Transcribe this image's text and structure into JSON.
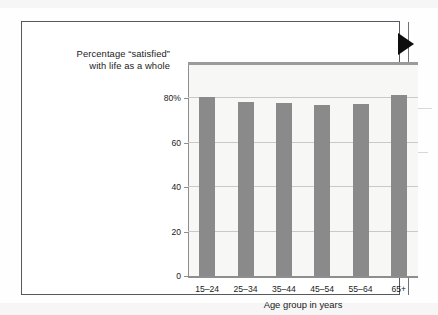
{
  "figure": {
    "marker_icon": "right-pointing-triangle"
  },
  "chart_data": {
    "type": "bar",
    "title": "Percentage “satisfied” with life as a whole",
    "title_lines": [
      "Percentage “satisfied”",
      "with life as a whole"
    ],
    "categories": [
      "15–24",
      "25–34",
      "35–44",
      "45–54",
      "55–64",
      "65+"
    ],
    "values": [
      80.5,
      78.5,
      78,
      77,
      77.5,
      81.5
    ],
    "xlabel": "Age group in years",
    "ylabel": "",
    "ylim": [
      0,
      95
    ],
    "yticks": [
      0,
      20,
      40,
      60,
      80
    ],
    "ytick_labels": [
      "0",
      "20",
      "40",
      "60",
      "80%"
    ],
    "grid": true,
    "legend": null,
    "bar_color": "#8a8a8a",
    "plot_background": "#f7f7f5"
  }
}
